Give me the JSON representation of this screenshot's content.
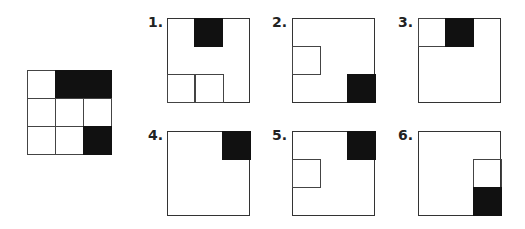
{
  "puzzle": {
    "main_grid": {
      "rows": 3,
      "cols": 3,
      "cells": [
        [
          "white",
          "black",
          "black"
        ],
        [
          "white",
          "white",
          "white"
        ],
        [
          "white",
          "white",
          "black"
        ]
      ]
    },
    "options": [
      {
        "label": "1.",
        "black": [
          [
            0,
            1
          ]
        ],
        "outline": [
          [
            2,
            0
          ],
          [
            2,
            1
          ]
        ]
      },
      {
        "label": "2.",
        "black": [
          [
            2,
            2
          ]
        ],
        "outline": [
          [
            1,
            0
          ]
        ]
      },
      {
        "label": "3.",
        "black": [
          [
            0,
            1
          ]
        ],
        "outline": [
          [
            0,
            0
          ]
        ]
      },
      {
        "label": "4.",
        "black": [
          [
            0,
            2
          ]
        ],
        "outline": []
      },
      {
        "label": "5.",
        "black": [
          [
            0,
            2
          ]
        ],
        "outline": [
          [
            1,
            0
          ]
        ]
      },
      {
        "label": "6.",
        "black": [
          [
            2,
            2
          ]
        ],
        "outline": [
          [
            1,
            2
          ]
        ]
      }
    ],
    "colors": {
      "fill": "#111111",
      "line": "#444444",
      "background": "#ffffff"
    }
  }
}
